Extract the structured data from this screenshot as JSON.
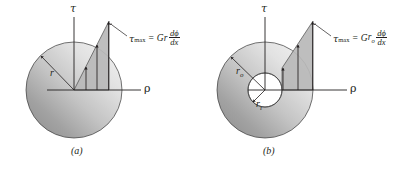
{
  "figure": {
    "background_color": "#ffffff",
    "line_color": "#231f20",
    "shaft_fill_light": "#f2f2f2",
    "shaft_fill_dark": "#8c8c8c",
    "stress_wedge_fill": "#b5b5b5"
  },
  "panels": [
    {
      "id": "a",
      "caption": "(a)",
      "description": "Solid circular shaft",
      "axis_vertical_label": "τ",
      "axis_horizontal_label": "ρ",
      "radius_labels": [
        {
          "name": "r",
          "symbol": "r",
          "subscript": ""
        }
      ],
      "formula": {
        "lhs_symbol": "τ",
        "lhs_subscript": "max",
        "equals": "=",
        "rhs_modulus": "G",
        "rhs_radius": "r",
        "rhs_radius_subscript": "",
        "numerator": "dϕ",
        "denominator": "dx",
        "plain": "τmax = Gr dϕ/dx"
      }
    },
    {
      "id": "b",
      "caption": "(b)",
      "description": "Hollow circular shaft",
      "axis_vertical_label": "τ",
      "axis_horizontal_label": "ρ",
      "radius_labels": [
        {
          "name": "r-outer",
          "symbol": "r",
          "subscript": "o"
        },
        {
          "name": "r-inner",
          "symbol": "r",
          "subscript": "i"
        }
      ],
      "formula": {
        "lhs_symbol": "τ",
        "lhs_subscript": "max",
        "equals": "=",
        "rhs_modulus": "G",
        "rhs_radius": "r",
        "rhs_radius_subscript": "o",
        "numerator": "dϕ",
        "denominator": "dx",
        "plain": "τmax = Gro dϕ/dx"
      }
    }
  ]
}
